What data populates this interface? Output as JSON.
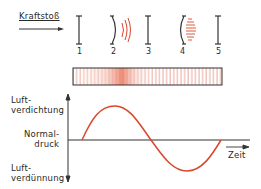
{
  "top": {
    "impulse_label": "Kraftstoß",
    "bar_numbers": [
      "1",
      "2",
      "3",
      "4",
      "5"
    ]
  },
  "graph": {
    "y_top_label_line1": "Luft-",
    "y_top_label_line2": "verdichtung",
    "mid_label_line1": "Normal-",
    "mid_label_line2": "druck",
    "y_bottom_label_line1": "Luft-",
    "y_bottom_label_line2": "verdünnung",
    "x_label": "Zeit"
  },
  "colors": {
    "wave": "#d9472b",
    "lines": "#333333",
    "tube_dense": "#e8735a",
    "tube_lines": "#e07b6a"
  }
}
